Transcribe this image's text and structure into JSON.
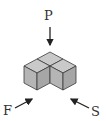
{
  "diagram": {
    "labels": {
      "top": "P",
      "front": "F",
      "side": "S"
    },
    "colors": {
      "top_face": "#c9c9c9",
      "left_face": "#b5b5b5",
      "right_face": "#a6a6a6",
      "edge": "#3a3a3a",
      "arrow": "#222222"
    },
    "cube_count": 3
  }
}
